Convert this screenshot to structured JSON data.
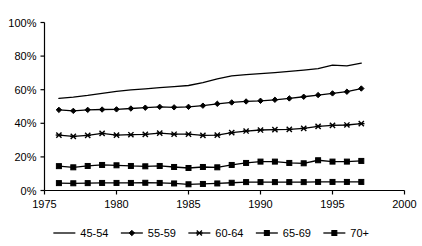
{
  "chart_data": {
    "type": "line",
    "title": "",
    "xlabel": "",
    "ylabel": "",
    "xlim": [
      1975,
      2000
    ],
    "ylim": [
      0,
      100
    ],
    "xticks": [
      1975,
      1980,
      1985,
      1990,
      1995,
      2000
    ],
    "xtick_labels": [
      "1975",
      "1980",
      "1985",
      "1990",
      "1995",
      "2000"
    ],
    "yticks": [
      0,
      20,
      40,
      60,
      80,
      100
    ],
    "ytick_labels": [
      "0%",
      "20%",
      "40%",
      "60%",
      "80%",
      "100%"
    ],
    "grid": false,
    "legend_position": "bottom",
    "x": [
      1976,
      1977,
      1978,
      1979,
      1980,
      1981,
      1982,
      1983,
      1984,
      1985,
      1986,
      1987,
      1988,
      1989,
      1990,
      1991,
      1992,
      1993,
      1994,
      1995,
      1996,
      1997
    ],
    "series": [
      {
        "name": "45-54",
        "marker": "none",
        "values": [
          54.8,
          55.6,
          56.6,
          57.8,
          59.0,
          59.9,
          60.5,
          61.2,
          61.8,
          62.5,
          64.2,
          66.4,
          68.2,
          69.0,
          69.6,
          70.2,
          70.9,
          71.7,
          72.6,
          74.6,
          74.2,
          75.8
        ]
      },
      {
        "name": "55-59",
        "marker": "diamond",
        "values": [
          48.0,
          47.4,
          48.0,
          48.2,
          48.3,
          48.8,
          49.3,
          49.8,
          49.5,
          49.8,
          50.5,
          51.6,
          52.4,
          53.0,
          53.4,
          54.0,
          54.8,
          55.8,
          56.8,
          57.8,
          58.8,
          60.7
        ]
      },
      {
        "name": "60-64",
        "marker": "x",
        "values": [
          33.0,
          32.2,
          32.8,
          34.0,
          33.0,
          33.2,
          33.4,
          34.2,
          33.5,
          33.5,
          32.8,
          33.0,
          34.4,
          35.4,
          36.0,
          36.2,
          36.4,
          37.0,
          38.2,
          38.8,
          39.0,
          39.8
        ]
      },
      {
        "name": "65-69",
        "marker": "square",
        "values": [
          14.5,
          13.8,
          14.6,
          15.2,
          15.0,
          14.6,
          14.4,
          14.6,
          14.0,
          13.4,
          14.0,
          13.8,
          15.2,
          16.4,
          17.2,
          17.2,
          16.4,
          16.2,
          18.0,
          17.2,
          17.2,
          17.6
        ]
      },
      {
        "name": "70+",
        "marker": "square",
        "values": [
          4.4,
          4.3,
          4.4,
          4.5,
          4.5,
          4.5,
          4.6,
          4.5,
          4.2,
          3.7,
          3.9,
          4.2,
          4.6,
          5.0,
          5.0,
          5.0,
          5.0,
          5.0,
          5.1,
          5.1,
          5.1,
          5.1
        ]
      }
    ]
  },
  "legend": {
    "items": [
      {
        "label": "45-54"
      },
      {
        "label": "55-59"
      },
      {
        "label": "60-64"
      },
      {
        "label": "65-69"
      },
      {
        "label": "70+"
      }
    ]
  },
  "colors": {
    "foreground": "#000000",
    "background": "#ffffff"
  }
}
